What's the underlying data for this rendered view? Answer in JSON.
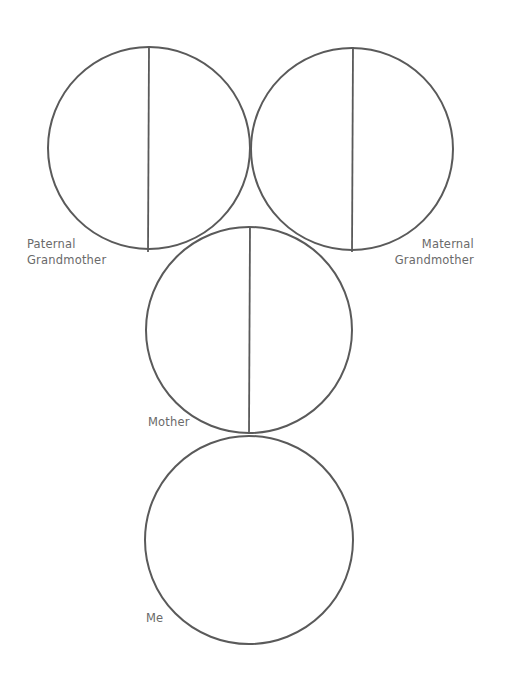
{
  "diagram": {
    "stroke_color": "#5a5a5a",
    "label_color": "#6a6a6a",
    "circles": [
      {
        "id": "paternal-grandmother",
        "cx": 149,
        "cy": 148,
        "r": 101,
        "divided": true,
        "label_lines": [
          "Paternal",
          "Grandmother"
        ]
      },
      {
        "id": "maternal-grandmother",
        "cx": 352,
        "cy": 149,
        "r": 101,
        "divided": true,
        "label_lines": [
          "Maternal",
          "Grandmother"
        ]
      },
      {
        "id": "mother",
        "cx": 249,
        "cy": 330,
        "r": 103,
        "divided": true,
        "label_lines": [
          "Mother"
        ]
      },
      {
        "id": "me",
        "cx": 249,
        "cy": 540,
        "r": 104,
        "divided": false,
        "label_lines": [
          "Me"
        ]
      }
    ]
  },
  "labels": {
    "paternal_grandmother": {
      "line1": "Paternal",
      "line2": "Grandmother"
    },
    "maternal_grandmother": {
      "line1": "Maternal",
      "line2": "Grandmother"
    },
    "mother": "Mother",
    "me": "Me"
  }
}
